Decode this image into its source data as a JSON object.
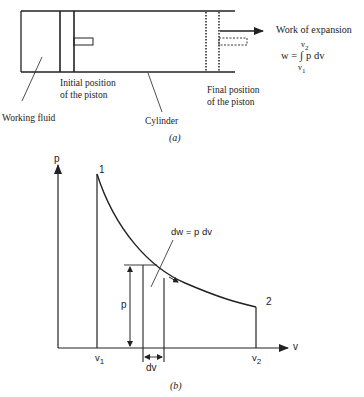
{
  "figure_a": {
    "caption": "(a)",
    "labels": {
      "work_title": "Work of expansion",
      "work_formula_lhs": "w =",
      "work_integral": "∫",
      "work_integrand": "p dv",
      "upper_limit": "v",
      "upper_sub": "2",
      "lower_limit": "v",
      "lower_sub": "1",
      "working_fluid": "Working fluid",
      "initial_piston_line1": "Initial position",
      "initial_piston_line2": "of the piston",
      "cylinder": "Cylinder",
      "final_piston_line1": "Final position",
      "final_piston_line2": "of the piston"
    }
  },
  "figure_b": {
    "caption": "(b)",
    "axis_p": "p",
    "axis_v": "v",
    "point_1": "1",
    "point_2": "2",
    "v1": "v",
    "v1_sub": "1",
    "v2": "v",
    "v2_sub": "2",
    "strip_height_label": "p",
    "strip_width_label": "dv",
    "dw_label": "dw = p dv"
  },
  "colors": {
    "ink": "#222222",
    "background": "#ffffff"
  }
}
